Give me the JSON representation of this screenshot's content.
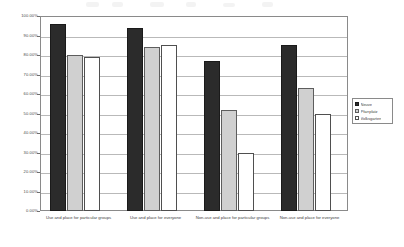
{
  "chart_data": {
    "type": "bar",
    "title": "",
    "subtitle": "",
    "xlabel": "",
    "ylabel": "",
    "ylim": [
      0,
      100
    ],
    "grid": true,
    "legend_position": "right",
    "value_suffix": "%",
    "categories": [
      "Use and place for particular groups",
      "Use and place for everyone",
      "Non-use and place for particular groups",
      "Non-use and place for everyone"
    ],
    "tick_labels": [
      "100.00%",
      "90.00%",
      "80.00%",
      "70.00%",
      "60.00%",
      "50.00%",
      "40.00%",
      "30.00%",
      "20.00%",
      "10.00%",
      "0.00%"
    ],
    "tick_values": [
      100,
      90,
      80,
      70,
      60,
      50,
      40,
      30,
      20,
      10,
      0
    ],
    "series": [
      {
        "name": "Neuve",
        "color": "#2b2b2b",
        "values": [
          96,
          94,
          77,
          85
        ]
      },
      {
        "name": "Pfarrplatz",
        "color": "#d0d0d0",
        "values": [
          80,
          84,
          52,
          63
        ]
      },
      {
        "name": "Volksgarten",
        "color": "#ffffff",
        "values": [
          79,
          85,
          30,
          50
        ]
      }
    ]
  },
  "legend": {
    "items": [
      "Neuve",
      "Pfarrplatz",
      "Volksgarten"
    ]
  }
}
